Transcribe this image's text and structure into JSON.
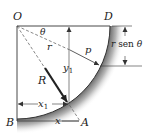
{
  "figure": {
    "type": "mechanics-diagram",
    "labels": {
      "O": "O",
      "D": "D",
      "B": "B",
      "A": "A",
      "theta": "θ",
      "r": "r",
      "p": "p",
      "R": "R",
      "y1": "y",
      "y1_sub": "1",
      "x1": "x",
      "x1_sub": "1",
      "x": "x",
      "rsen_r": "r",
      "rsen_text": " sen ",
      "rsen_theta": "θ"
    },
    "colors": {
      "line": "#333333",
      "arrow": "#2a2a2a",
      "shade": "#9a9a9a",
      "dash": "#555555"
    }
  }
}
